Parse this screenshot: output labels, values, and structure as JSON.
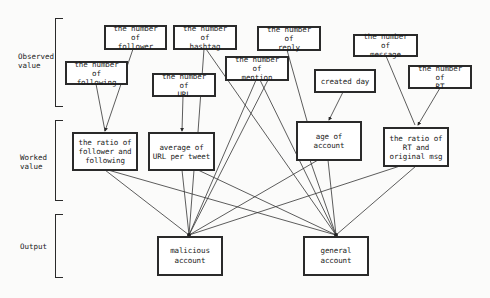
{
  "levels": {
    "observed": {
      "label": "Observed\nvalue"
    },
    "worked": {
      "label": "Worked\nvalue"
    },
    "output": {
      "label": "Output"
    }
  },
  "nodes": {
    "follower": {
      "label": "the number of\nfollower"
    },
    "hashtag": {
      "label": "the number of\nhashtag"
    },
    "reply": {
      "label": "the number of\nreply"
    },
    "message": {
      "label": "the number of\nmessage"
    },
    "following": {
      "label": "the number of\nfollowing"
    },
    "url": {
      "label": "the number of\nURL"
    },
    "mention": {
      "label": "the number of\nmention"
    },
    "created_day": {
      "label": "created day"
    },
    "rt": {
      "label": "the number of\nRT"
    },
    "ratio_follow": {
      "label": "the ratio of\nfollower and\nfollowing"
    },
    "avg_url": {
      "label": "average of\nURL per tweet"
    },
    "age_account": {
      "label": "age of\naccount"
    },
    "ratio_rt": {
      "label": "the ratio of\nRT and\noriginal msg"
    },
    "malicious": {
      "label": "malicious\naccount"
    },
    "general": {
      "label": "general\naccount"
    }
  },
  "edges": [
    {
      "from": "follower",
      "to": "ratio_follow"
    },
    {
      "from": "following",
      "to": "ratio_follow"
    },
    {
      "from": "url",
      "to": "avg_url"
    },
    {
      "from": "hashtag",
      "to": "avg_url"
    },
    {
      "from": "hashtag",
      "to": "general"
    },
    {
      "from": "reply",
      "to": "age_account"
    },
    {
      "from": "created_day",
      "to": "age_account"
    },
    {
      "from": "message",
      "to": "ratio_rt"
    },
    {
      "from": "rt",
      "to": "ratio_rt"
    },
    {
      "from": "mention",
      "to": "malicious"
    },
    {
      "from": "mention",
      "to": "malicious"
    },
    {
      "from": "mention",
      "to": "general"
    },
    {
      "from": "ratio_follow",
      "to": "malicious"
    },
    {
      "from": "ratio_follow",
      "to": "general"
    },
    {
      "from": "avg_url",
      "to": "malicious"
    },
    {
      "from": "avg_url",
      "to": "general"
    },
    {
      "from": "age_account",
      "to": "malicious"
    },
    {
      "from": "age_account",
      "to": "general"
    },
    {
      "from": "ratio_rt",
      "to": "malicious"
    },
    {
      "from": "ratio_rt",
      "to": "general"
    }
  ]
}
